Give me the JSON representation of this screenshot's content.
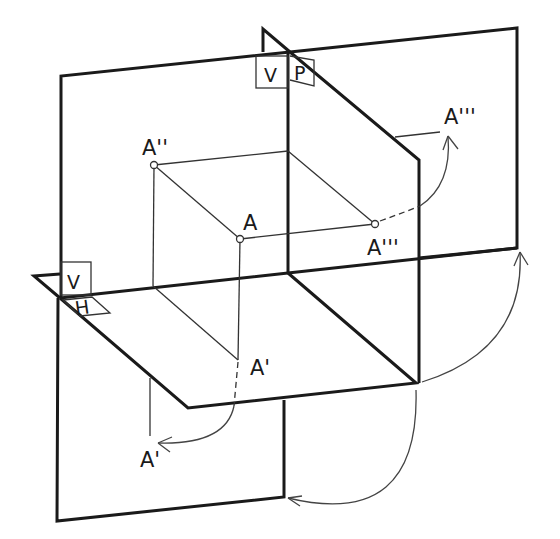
{
  "diagram": {
    "type": "orthographic-projection-three-planes",
    "planes": {
      "vertical": "V",
      "horizontal": "H",
      "profile": "P"
    },
    "plane_labels": {
      "top_v": "V",
      "top_p": "P",
      "left_v": "V",
      "left_h": "H"
    },
    "points": {
      "space_point": "A",
      "front_projection": "A''",
      "top_projection": "A'",
      "side_projection": "A'''",
      "top_projection_rotated": "A'",
      "side_projection_rotated": "A'''"
    },
    "colors": {
      "line": "#1a1a1a",
      "background": "#ffffff"
    }
  }
}
